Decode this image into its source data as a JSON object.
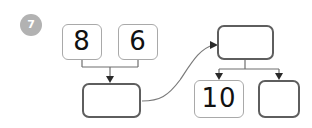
{
  "exercise": {
    "number_badge": "7",
    "badge_color": "#b2b2b2",
    "badge_text_color": "#ffffff"
  },
  "colors": {
    "page_background": "#ffffff",
    "light_box_border": "#a9a9a9",
    "dark_box_border": "#5e5e5e",
    "connector_line": "#6e6e6e",
    "curve_line": "#7a7a7a",
    "digit_color": "#111111"
  },
  "diagram": {
    "type": "number-bond-part-whole",
    "left_group": {
      "addend_one": "8",
      "addend_two": "6",
      "sum_box_value": ""
    },
    "right_group": {
      "whole_box_value": "",
      "part_one": "10",
      "part_two": ""
    },
    "boxes": [
      {
        "id": "box-eight",
        "label": "8",
        "filled": true,
        "style": "light"
      },
      {
        "id": "box-six",
        "label": "6",
        "filled": true,
        "style": "light"
      },
      {
        "id": "box-sum",
        "label": "",
        "filled": false,
        "style": "dark"
      },
      {
        "id": "box-whole",
        "label": "",
        "filled": false,
        "style": "dark"
      },
      {
        "id": "box-ten",
        "label": "10",
        "filled": true,
        "style": "light"
      },
      {
        "id": "box-part",
        "label": "",
        "filled": false,
        "style": "dark"
      }
    ],
    "connectors": [
      {
        "name": "eight-and-six-to-sum",
        "kind": "bracket-down-arrow"
      },
      {
        "name": "sum-to-whole",
        "kind": "curved-arrow"
      },
      {
        "name": "whole-to-parts",
        "kind": "bracket-down-arrows"
      }
    ]
  }
}
